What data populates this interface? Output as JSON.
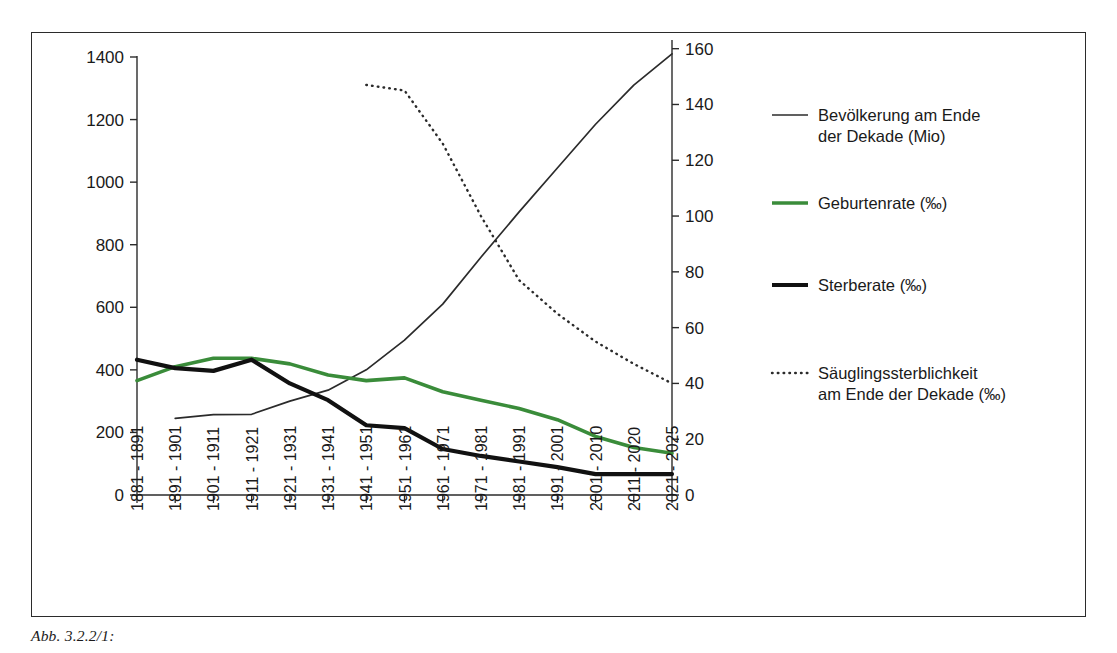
{
  "figure": {
    "caption": "Abb. 3.2.2/1:",
    "background": "#ffffff",
    "frame_color": "#2b2b2b"
  },
  "colors": {
    "population": "#2b2b2b",
    "birth_rate": "#3a8c3a",
    "death_rate": "#111111",
    "infant_mortality": "#2b2b2b"
  },
  "chart_data": {
    "type": "line",
    "title": "",
    "xlabel": "",
    "ylabel": "",
    "grid": false,
    "legend_position": "right",
    "categories": [
      "1881 - 1891",
      "1891 - 1901",
      "1901 - 1911",
      "1911 - 1921",
      "1921 - 1931",
      "1931 - 1941",
      "1941 - 1951",
      "1951 - 1961",
      "1961 - 1971",
      "1971 - 1981",
      "1981 - 1991",
      "1991 - 2001",
      "2001 - 2010",
      "2011 - 2020",
      "2021 - 2025"
    ],
    "axes": {
      "left": {
        "label": "",
        "ylim": [
          0,
          1400
        ],
        "ticks": [
          0,
          200,
          400,
          600,
          800,
          1000,
          1200,
          1400
        ],
        "tick_labels": [
          "0",
          "200",
          "400",
          "600",
          "800",
          "1000",
          "1200",
          "1400"
        ]
      },
      "right": {
        "label": "",
        "ylim": [
          0,
          171
        ],
        "ticks": [
          0,
          20,
          40,
          60,
          80,
          100,
          120,
          140,
          160
        ],
        "tick_labels": [
          "0",
          "20",
          "40",
          "60",
          "80",
          "100",
          "120",
          "140",
          "160"
        ]
      }
    },
    "series": [
      {
        "name": "Bevölkerung am Ende der Dekade (Mio)",
        "axis": "left",
        "style": "solid-thin",
        "color": "#2b2b2b",
        "values": [
          null,
          245,
          257,
          258,
          300,
          335,
          400,
          495,
          610,
          760,
          905,
          1045,
          1185,
          1310,
          1410
        ]
      },
      {
        "name": "Geburtenrate (‰)",
        "axis": "right",
        "style": "solid-green",
        "color": "#3a8c3a",
        "values": [
          41,
          46,
          49,
          49,
          47,
          43,
          41,
          42,
          37,
          34,
          31,
          27,
          21,
          17,
          15
        ]
      },
      {
        "name": "Sterberate (‰)",
        "axis": "right",
        "style": "solid-thick",
        "color": "#111111",
        "values": [
          48.5,
          45.5,
          44.5,
          48.5,
          40,
          34,
          25,
          24,
          16.5,
          14,
          12,
          10,
          7.5,
          7.5,
          7.5
        ]
      },
      {
        "name": "Säuglingssterblichkeit am Ende der Dekade (‰)",
        "axis": "right",
        "style": "dotted",
        "color": "#2b2b2b",
        "values": [
          null,
          null,
          null,
          null,
          null,
          null,
          147,
          145,
          126,
          100,
          77,
          65,
          55,
          47,
          40
        ]
      }
    ]
  },
  "legend": {
    "items": [
      {
        "key": "population",
        "style": "solid-thin",
        "color": "#2b2b2b",
        "line1": "Bevölkerung am Ende",
        "line2": "der Dekade (Mio)"
      },
      {
        "key": "birth-rate",
        "style": "solid-green",
        "color": "#3a8c3a",
        "line1": "Geburtenrate (‰)",
        "line2": ""
      },
      {
        "key": "death-rate",
        "style": "solid-thick",
        "color": "#111111",
        "line1": "Sterberate (‰)",
        "line2": ""
      },
      {
        "key": "infant-mortality",
        "style": "dotted",
        "color": "#2b2b2b",
        "line1": "Säuglingssterblichkeit",
        "line2": "am Ende der Dekade (‰)"
      }
    ]
  }
}
